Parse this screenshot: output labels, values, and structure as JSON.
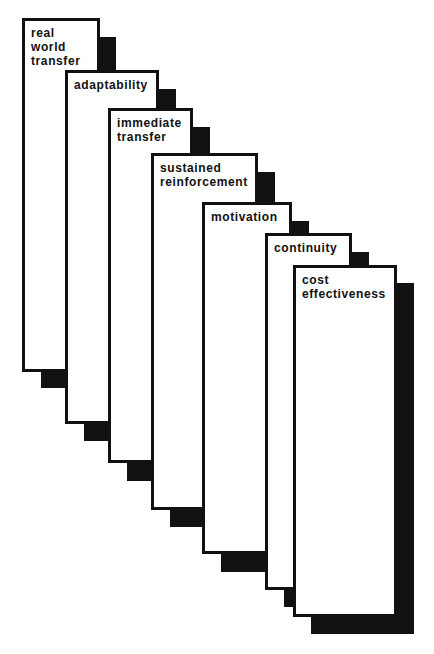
{
  "diagram": {
    "type": "staggered-stack",
    "colors": {
      "background": "#ffffff",
      "border": "#111111",
      "shadow": "#111111",
      "text": "#111111"
    },
    "cards": [
      {
        "label": "real\nworld\ntransfer"
      },
      {
        "label": "adaptability"
      },
      {
        "label": "immediate\ntransfer"
      },
      {
        "label": "sustained\nreinforcement"
      },
      {
        "label": "motivation"
      },
      {
        "label": "continuity"
      },
      {
        "label": "cost\neffectiveness"
      }
    ]
  }
}
